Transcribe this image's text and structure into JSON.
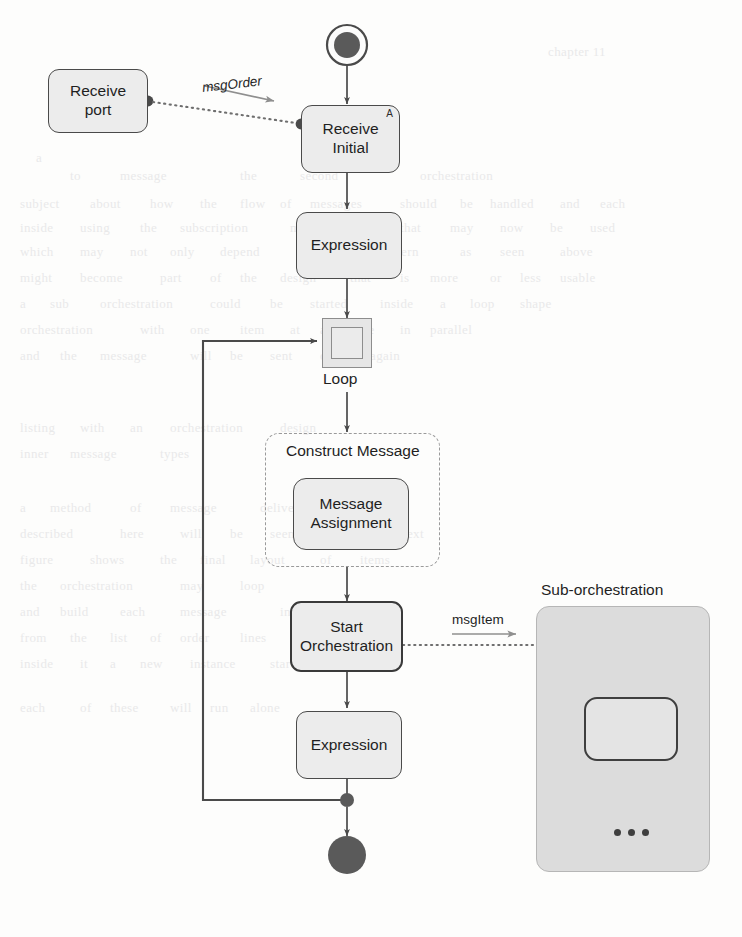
{
  "diagram": {
    "type": "orchestration-flow"
  },
  "nodes": {
    "receive_port": "Receive\nport",
    "receive_initial": "Receive\nInitial",
    "receive_initial_marker": "A",
    "expression_1": "Expression",
    "loop_label": "Loop",
    "construct_message": "Construct Message",
    "message_assignment": "Message\nAssignment",
    "start_orchestration": "Start\nOrchestration",
    "expression_2": "Expression",
    "suborchestration_title": "Sub-orchestration",
    "suborchestration_ellipsis": "..."
  },
  "connectors": {
    "msg_order": "msgOrder",
    "msg_item": "msgItem"
  },
  "colors": {
    "node_fill": "#ececec",
    "node_border": "#4a4a4a",
    "panel_fill": "#dcdcdc",
    "dashed_border": "#9a9a9a",
    "flow_line": "#4a4a4a",
    "terminator_fill": "#5a5a5a",
    "page_background": "#fdfdfc"
  },
  "ghost_text": [
    {
      "text": "chapter 11",
      "x": 548,
      "y": 44
    },
    {
      "text": "a",
      "x": 36,
      "y": 150
    },
    {
      "text": "to",
      "x": 70,
      "y": 168
    },
    {
      "text": "message",
      "x": 120,
      "y": 168
    },
    {
      "text": "the",
      "x": 240,
      "y": 168
    },
    {
      "text": "second",
      "x": 300,
      "y": 168
    },
    {
      "text": "orchestration",
      "x": 420,
      "y": 168
    },
    {
      "text": "subject",
      "x": 20,
      "y": 196
    },
    {
      "text": "about",
      "x": 90,
      "y": 196
    },
    {
      "text": "how",
      "x": 150,
      "y": 196
    },
    {
      "text": "the",
      "x": 200,
      "y": 196
    },
    {
      "text": "flow",
      "x": 240,
      "y": 196
    },
    {
      "text": "of",
      "x": 280,
      "y": 196
    },
    {
      "text": "messages",
      "x": 310,
      "y": 196
    },
    {
      "text": "should",
      "x": 400,
      "y": 196
    },
    {
      "text": "be",
      "x": 460,
      "y": 196
    },
    {
      "text": "handled",
      "x": 490,
      "y": 196
    },
    {
      "text": "and",
      "x": 560,
      "y": 196
    },
    {
      "text": "each",
      "x": 600,
      "y": 196
    },
    {
      "text": "inside",
      "x": 20,
      "y": 220
    },
    {
      "text": "using",
      "x": 80,
      "y": 220
    },
    {
      "text": "the",
      "x": 140,
      "y": 220
    },
    {
      "text": "subscription",
      "x": 180,
      "y": 220
    },
    {
      "text": "mechanism",
      "x": 290,
      "y": 220
    },
    {
      "text": "that",
      "x": 400,
      "y": 220
    },
    {
      "text": "may",
      "x": 450,
      "y": 220
    },
    {
      "text": "now",
      "x": 500,
      "y": 220
    },
    {
      "text": "be",
      "x": 550,
      "y": 220
    },
    {
      "text": "used",
      "x": 590,
      "y": 220
    },
    {
      "text": "which",
      "x": 20,
      "y": 244
    },
    {
      "text": "may",
      "x": 80,
      "y": 244
    },
    {
      "text": "not",
      "x": 130,
      "y": 244
    },
    {
      "text": "only",
      "x": 170,
      "y": 244
    },
    {
      "text": "depend",
      "x": 220,
      "y": 244
    },
    {
      "text": "on",
      "x": 300,
      "y": 244
    },
    {
      "text": "the",
      "x": 340,
      "y": 244
    },
    {
      "text": "pattern",
      "x": 380,
      "y": 244
    },
    {
      "text": "as",
      "x": 460,
      "y": 244
    },
    {
      "text": "seen",
      "x": 500,
      "y": 244
    },
    {
      "text": "above",
      "x": 560,
      "y": 244
    },
    {
      "text": "might",
      "x": 20,
      "y": 270
    },
    {
      "text": "become",
      "x": 80,
      "y": 270
    },
    {
      "text": "part",
      "x": 160,
      "y": 270
    },
    {
      "text": "of",
      "x": 210,
      "y": 270
    },
    {
      "text": "the",
      "x": 240,
      "y": 270
    },
    {
      "text": "design",
      "x": 280,
      "y": 270
    },
    {
      "text": "that",
      "x": 350,
      "y": 270
    },
    {
      "text": "is",
      "x": 400,
      "y": 270
    },
    {
      "text": "more",
      "x": 430,
      "y": 270
    },
    {
      "text": "or",
      "x": 490,
      "y": 270
    },
    {
      "text": "less",
      "x": 520,
      "y": 270
    },
    {
      "text": "usable",
      "x": 560,
      "y": 270
    },
    {
      "text": "a",
      "x": 20,
      "y": 296
    },
    {
      "text": "sub",
      "x": 50,
      "y": 296
    },
    {
      "text": "orchestration",
      "x": 100,
      "y": 296
    },
    {
      "text": "could",
      "x": 210,
      "y": 296
    },
    {
      "text": "be",
      "x": 270,
      "y": 296
    },
    {
      "text": "started",
      "x": 310,
      "y": 296
    },
    {
      "text": "inside",
      "x": 380,
      "y": 296
    },
    {
      "text": "a",
      "x": 440,
      "y": 296
    },
    {
      "text": "loop",
      "x": 470,
      "y": 296
    },
    {
      "text": "shape",
      "x": 520,
      "y": 296
    },
    {
      "text": "orchestration",
      "x": 20,
      "y": 322
    },
    {
      "text": "with",
      "x": 140,
      "y": 322
    },
    {
      "text": "one",
      "x": 190,
      "y": 322
    },
    {
      "text": "item",
      "x": 240,
      "y": 322
    },
    {
      "text": "at",
      "x": 290,
      "y": 322
    },
    {
      "text": "a",
      "x": 320,
      "y": 322
    },
    {
      "text": "time",
      "x": 350,
      "y": 322
    },
    {
      "text": "in",
      "x": 400,
      "y": 322
    },
    {
      "text": "parallel",
      "x": 430,
      "y": 322
    },
    {
      "text": "and",
      "x": 20,
      "y": 348
    },
    {
      "text": "the",
      "x": 60,
      "y": 348
    },
    {
      "text": "message",
      "x": 100,
      "y": 348
    },
    {
      "text": "will",
      "x": 190,
      "y": 348
    },
    {
      "text": "be",
      "x": 230,
      "y": 348
    },
    {
      "text": "sent",
      "x": 270,
      "y": 348
    },
    {
      "text": "out",
      "x": 320,
      "y": 348
    },
    {
      "text": "again",
      "x": 370,
      "y": 348
    },
    {
      "text": "listing",
      "x": 20,
      "y": 420
    },
    {
      "text": "with",
      "x": 80,
      "y": 420
    },
    {
      "text": "an",
      "x": 130,
      "y": 420
    },
    {
      "text": "orchestration",
      "x": 170,
      "y": 420
    },
    {
      "text": "design",
      "x": 280,
      "y": 420
    },
    {
      "text": "inner",
      "x": 20,
      "y": 446
    },
    {
      "text": "message",
      "x": 70,
      "y": 446
    },
    {
      "text": "types",
      "x": 160,
      "y": 446
    },
    {
      "text": "a",
      "x": 20,
      "y": 500
    },
    {
      "text": "method",
      "x": 50,
      "y": 500
    },
    {
      "text": "of",
      "x": 130,
      "y": 500
    },
    {
      "text": "message",
      "x": 170,
      "y": 500
    },
    {
      "text": "delivery",
      "x": 260,
      "y": 500
    },
    {
      "text": "described",
      "x": 20,
      "y": 526
    },
    {
      "text": "here",
      "x": 120,
      "y": 526
    },
    {
      "text": "will",
      "x": 180,
      "y": 526
    },
    {
      "text": "be",
      "x": 230,
      "y": 526
    },
    {
      "text": "seen",
      "x": 270,
      "y": 526
    },
    {
      "text": "in",
      "x": 330,
      "y": 526
    },
    {
      "text": "the",
      "x": 360,
      "y": 526
    },
    {
      "text": "next",
      "x": 400,
      "y": 526
    },
    {
      "text": "figure",
      "x": 20,
      "y": 552
    },
    {
      "text": "shows",
      "x": 90,
      "y": 552
    },
    {
      "text": "the",
      "x": 160,
      "y": 552
    },
    {
      "text": "final",
      "x": 200,
      "y": 552
    },
    {
      "text": "layout",
      "x": 250,
      "y": 552
    },
    {
      "text": "of",
      "x": 320,
      "y": 552
    },
    {
      "text": "items",
      "x": 360,
      "y": 552
    },
    {
      "text": "the",
      "x": 20,
      "y": 578
    },
    {
      "text": "orchestration",
      "x": 60,
      "y": 578
    },
    {
      "text": "may",
      "x": 180,
      "y": 578
    },
    {
      "text": "loop",
      "x": 240,
      "y": 578
    },
    {
      "text": "and",
      "x": 20,
      "y": 604
    },
    {
      "text": "build",
      "x": 60,
      "y": 604
    },
    {
      "text": "each",
      "x": 120,
      "y": 604
    },
    {
      "text": "message",
      "x": 180,
      "y": 604
    },
    {
      "text": "in",
      "x": 280,
      "y": 604
    },
    {
      "text": "turn",
      "x": 320,
      "y": 604
    },
    {
      "text": "from",
      "x": 20,
      "y": 630
    },
    {
      "text": "the",
      "x": 70,
      "y": 630
    },
    {
      "text": "list",
      "x": 110,
      "y": 630
    },
    {
      "text": "of",
      "x": 150,
      "y": 630
    },
    {
      "text": "order",
      "x": 180,
      "y": 630
    },
    {
      "text": "lines",
      "x": 240,
      "y": 630
    },
    {
      "text": "inside",
      "x": 20,
      "y": 656
    },
    {
      "text": "it",
      "x": 80,
      "y": 656
    },
    {
      "text": "a",
      "x": 110,
      "y": 656
    },
    {
      "text": "new",
      "x": 140,
      "y": 656
    },
    {
      "text": "instance",
      "x": 190,
      "y": 656
    },
    {
      "text": "starts",
      "x": 270,
      "y": 656
    },
    {
      "text": "and",
      "x": 330,
      "y": 656
    },
    {
      "text": "each",
      "x": 20,
      "y": 700
    },
    {
      "text": "of",
      "x": 80,
      "y": 700
    },
    {
      "text": "these",
      "x": 110,
      "y": 700
    },
    {
      "text": "will",
      "x": 170,
      "y": 700
    },
    {
      "text": "run",
      "x": 210,
      "y": 700
    },
    {
      "text": "alone",
      "x": 250,
      "y": 700
    }
  ]
}
